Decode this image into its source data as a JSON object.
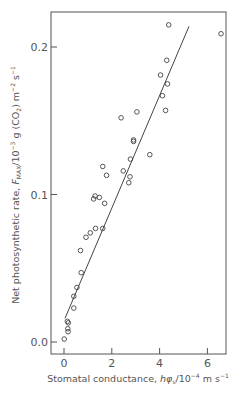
{
  "chart_data": {
    "type": "scatter",
    "title": "",
    "xlabel": "Stomatal conductance, hφs/10⁻⁴ m s⁻¹",
    "ylabel": "Net photosynthetic rate, FMAX/10⁻³ g (CO₂) m⁻² s⁻¹",
    "xlim": [
      -0.5,
      6.9
    ],
    "ylim": [
      -0.009,
      0.227
    ],
    "x_ticks": [
      0,
      2,
      4,
      6
    ],
    "x_tick_labels": [
      "0",
      "2",
      "4",
      "6"
    ],
    "y_ticks": [
      0.0,
      0.1,
      0.2
    ],
    "y_tick_labels": [
      "0.0",
      "0.1",
      "0.2"
    ],
    "grid": false,
    "legend": null,
    "marker": "open-circle",
    "series": [
      {
        "name": "observations",
        "points": [
          [
            0.01,
            0.002
          ],
          [
            0.17,
            0.007
          ],
          [
            0.16,
            0.009
          ],
          [
            0.14,
            0.014
          ],
          [
            0.18,
            0.013
          ],
          [
            0.41,
            0.023
          ],
          [
            0.41,
            0.031
          ],
          [
            0.54,
            0.037
          ],
          [
            0.72,
            0.047
          ],
          [
            0.69,
            0.062
          ],
          [
            0.92,
            0.071
          ],
          [
            1.1,
            0.074
          ],
          [
            1.32,
            0.077
          ],
          [
            1.62,
            0.077
          ],
          [
            1.3,
            0.099
          ],
          [
            1.24,
            0.097
          ],
          [
            1.48,
            0.098
          ],
          [
            1.7,
            0.094
          ],
          [
            1.62,
            0.119
          ],
          [
            1.78,
            0.113
          ],
          [
            2.48,
            0.116
          ],
          [
            2.76,
            0.112
          ],
          [
            2.71,
            0.108
          ],
          [
            2.78,
            0.124
          ],
          [
            2.91,
            0.137
          ],
          [
            2.91,
            0.136
          ],
          [
            3.59,
            0.127
          ],
          [
            2.39,
            0.152
          ],
          [
            3.05,
            0.156
          ],
          [
            4.25,
            0.157
          ],
          [
            4.12,
            0.167
          ],
          [
            4.33,
            0.175
          ],
          [
            4.04,
            0.181
          ],
          [
            4.3,
            0.191
          ],
          [
            4.38,
            0.215
          ],
          [
            6.57,
            0.209
          ]
        ]
      }
    ],
    "fit_line": {
      "from": [
        0.04,
        0.016
      ],
      "to": [
        5.23,
        0.214
      ]
    }
  },
  "labels": {
    "x_axis_main": "Stomatal conductance, ",
    "x_axis_symbol": "hφ",
    "x_axis_sub": "s",
    "x_axis_unit": "/10",
    "x_axis_exp": "−4",
    "x_axis_tail": " m s",
    "x_axis_tail_exp": "−1",
    "y_axis_main": "Net photosynthetic rate, ",
    "y_axis_symbol": "F",
    "y_axis_sub": "MAX",
    "y_axis_unit": "/10",
    "y_axis_exp": "−3",
    "y_axis_mid": " g (CO",
    "y_axis_mid_sub": "2",
    "y_axis_mid2": ") m",
    "y_axis_exp2": "−2",
    "y_axis_tail": " s",
    "y_axis_tail_exp": "−1"
  },
  "colors": {
    "ink": "#444444",
    "background": "#ffffff"
  }
}
